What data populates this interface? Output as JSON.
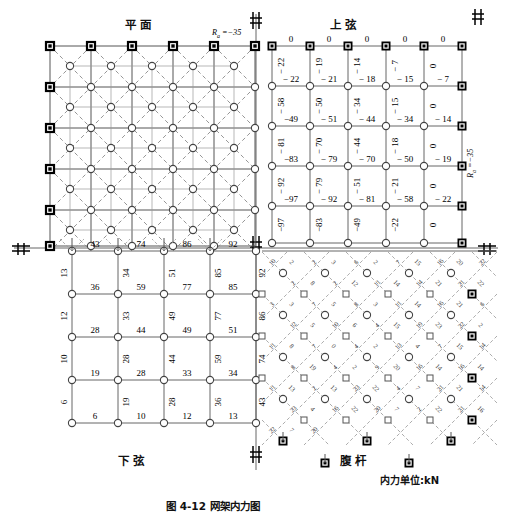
{
  "figure": {
    "caption": "图 4-12  网架内力图",
    "unit_note": "内力单位:kN",
    "quadrant_titles": {
      "plan": "平  面",
      "upper_chord": "上  弦",
      "lower_chord": "下  弦",
      "web": "腹  杆"
    },
    "support_reaction_top": {
      "symbol": "R",
      "subscript": "a",
      "value": "-35",
      "text": "Ra =-35"
    },
    "support_reaction_right": {
      "symbol": "R",
      "subscript": "a",
      "value": "-35",
      "text": "Ra =-35"
    }
  },
  "upper_chord": {
    "grid_cols": 6,
    "grid_rows": 6,
    "horizontal_rows": [
      [
        "0",
        "0",
        "0",
        "0",
        "0"
      ],
      [
        "− 22",
        "− 21",
        "− 18",
        "− 15",
        "− 7"
      ],
      [
        "−49",
        "− 51",
        "− 44",
        "− 34",
        "− 14"
      ],
      [
        "−83",
        "− 79",
        "− 70",
        "− 50",
        "− 19"
      ],
      [
        "−97",
        "− 92",
        "− 81",
        "− 58",
        "− 22"
      ]
    ],
    "vertical_rows": [
      [
        "− 22",
        "− 19",
        "− 14",
        "− 7",
        "0"
      ],
      [
        "− 58",
        "− 50",
        "− 34",
        "− 15",
        "0"
      ],
      [
        "− 81",
        "− 70",
        "− 44",
        "− 18",
        "0"
      ],
      [
        "− 92",
        "− 79",
        "− 51",
        "− 21",
        "0"
      ],
      [
        "−97",
        "−83",
        "−49",
        "−22",
        "0"
      ]
    ]
  },
  "lower_chord": {
    "grid_cols": 6,
    "grid_rows": 6,
    "horizontal_rows": [
      [
        "43",
        "74",
        "86",
        "92"
      ],
      [
        "36",
        "59",
        "77",
        "85"
      ],
      [
        "28",
        "44",
        "49",
        "51"
      ],
      [
        "19",
        "28",
        "33",
        "34"
      ],
      [
        "6",
        "10",
        "12",
        "13"
      ]
    ],
    "vertical_rows": [
      [
        "13",
        "34",
        "51",
        "85",
        "92"
      ],
      [
        "12",
        "33",
        "49",
        "77",
        "86"
      ],
      [
        "10",
        "28",
        "44",
        "59",
        "74"
      ],
      [
        "6",
        "19",
        "28",
        "36",
        "43"
      ]
    ]
  },
  "web_members": {
    "note": "斜腹杆内力，沿斜杆方向标注",
    "values": [
      "10",
      "2",
      "2",
      "3",
      "6",
      "2",
      "7",
      "15",
      "16",
      "20",
      "22",
      "2",
      "8",
      "2",
      "12",
      "11",
      "14",
      "14",
      "21",
      "21",
      "22",
      "3",
      "3",
      "7",
      "5",
      "8",
      "3",
      "11",
      "14",
      "16",
      "21",
      "6",
      "12",
      "5",
      "10",
      "6",
      "4",
      "15",
      "19",
      "23",
      "22",
      "2",
      "11",
      "8",
      "7",
      "0",
      "4",
      "2",
      "13",
      "4",
      "7",
      "15",
      "14",
      "8",
      "19",
      "4",
      "2",
      "9",
      "20",
      "16",
      "14",
      "16",
      "14",
      "11",
      "13",
      "2",
      "13",
      "23",
      "22",
      "4",
      "7",
      "21",
      "21",
      "14",
      "23",
      "4",
      "16",
      "22",
      "20",
      "7",
      "2",
      "22",
      "21",
      "16",
      "22",
      "7",
      "20"
    ]
  },
  "plan_view": {
    "description": "网架平面布置：上弦方格网与斜腹杆（虚线）",
    "grid_cols": 6,
    "grid_rows": 6,
    "support_nodes": 16,
    "node_types": [
      "support-square",
      "chord-circle"
    ]
  }
}
